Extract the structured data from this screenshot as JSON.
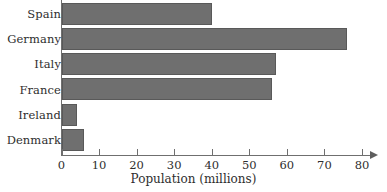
{
  "chart_data": {
    "type": "bar",
    "orientation": "horizontal",
    "title": "",
    "xlabel": "Population (millions)",
    "ylabel": "",
    "categories": [
      "Spain",
      "Germany",
      "Italy",
      "France",
      "Ireland",
      "Denmark"
    ],
    "values": [
      40,
      76,
      57,
      56,
      4,
      6
    ],
    "xlim": [
      0,
      80
    ],
    "xticks": [
      0,
      10,
      20,
      30,
      40,
      50,
      60,
      70,
      80
    ],
    "xtick_labels": [
      "0",
      "10",
      "20",
      "30",
      "40",
      "50",
      "60",
      "70",
      "80"
    ],
    "grid": false,
    "legend": null,
    "series": [
      {
        "name": "Population",
        "values": [
          40,
          76,
          57,
          56,
          4,
          6
        ]
      }
    ],
    "bar_color": "#6f6f6f",
    "bar_border_color": "#595959",
    "axis_color": "#6f6f6f",
    "background_color": "#ffffff",
    "axis_arrow": true
  }
}
